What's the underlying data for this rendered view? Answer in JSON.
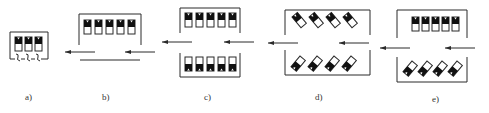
{
  "figure": {
    "colors": {
      "stroke": "#2a2a2a",
      "fill_dark": "#111111",
      "background": "#ffffff"
    },
    "panels": [
      {
        "id": "a",
        "label": "a)",
        "cells": 3,
        "orientation": "upright",
        "feature": "squiggle-connectors"
      },
      {
        "id": "b",
        "label": "b)",
        "cells": 5,
        "orientation": "upright",
        "feature": "open-bottom-with-baseline"
      },
      {
        "id": "c",
        "label": "c)",
        "cells_top": 5,
        "cells_bottom": 5,
        "orientation": "mirrored-vertical"
      },
      {
        "id": "d",
        "label": "d)",
        "cells_top": 4,
        "cells_bottom": 4,
        "orientation": "tilted"
      },
      {
        "id": "e",
        "label": "e)",
        "cells_top": 5,
        "cells_bottom": 4,
        "orientation": "upright-top tilted-bottom"
      }
    ],
    "arrows": {
      "direction": "left",
      "count": 8
    }
  }
}
